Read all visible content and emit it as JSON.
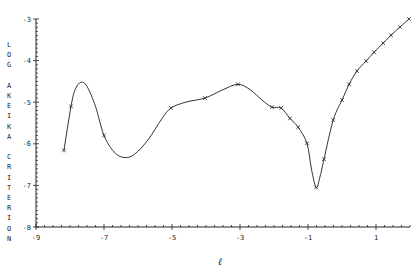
{
  "chart_data": {
    "type": "line",
    "title": "",
    "xlabel": "ℓ",
    "ylabel": "LOG AKAIKE CRITERION",
    "ylabel_letters": [
      "L",
      "O",
      "G",
      "",
      "A",
      "K",
      "E",
      "I",
      "K",
      "A",
      "",
      "C",
      "R",
      "I",
      "T",
      "E",
      "R",
      "I",
      "O",
      "N"
    ],
    "xlim": [
      -9,
      2
    ],
    "ylim": [
      -8,
      -3
    ],
    "xticks": [
      -9,
      -7,
      -5,
      -3,
      -1,
      1
    ],
    "yticks": [
      -3,
      -4,
      -5,
      -6,
      -7,
      -8
    ],
    "minor_ticks": true,
    "grid": false,
    "legend": null,
    "series": [
      {
        "name": "criterion",
        "marker": "x",
        "markers": [
          {
            "x": -8.18,
            "y": -6.16
          },
          {
            "x": -7.97,
            "y": -5.1
          },
          {
            "x": -7.0,
            "y": -5.8
          },
          {
            "x": -5.03,
            "y": -5.14
          },
          {
            "x": -4.03,
            "y": -4.9
          },
          {
            "x": -3.06,
            "y": -4.57
          },
          {
            "x": -2.06,
            "y": -5.12
          },
          {
            "x": -1.79,
            "y": -5.14
          },
          {
            "x": -1.53,
            "y": -5.39
          },
          {
            "x": -1.29,
            "y": -5.6
          },
          {
            "x": -1.03,
            "y": -5.99
          },
          {
            "x": -0.76,
            "y": -7.05
          },
          {
            "x": -0.53,
            "y": -6.37
          },
          {
            "x": -0.26,
            "y": -5.43
          },
          {
            "x": 0.0,
            "y": -4.95
          },
          {
            "x": 0.21,
            "y": -4.57
          },
          {
            "x": 0.44,
            "y": -4.25
          },
          {
            "x": 0.71,
            "y": -4.01
          },
          {
            "x": 0.94,
            "y": -3.8
          },
          {
            "x": 1.21,
            "y": -3.58
          },
          {
            "x": 1.44,
            "y": -3.39
          },
          {
            "x": 1.71,
            "y": -3.19
          },
          {
            "x": 1.97,
            "y": -3.0
          }
        ],
        "curve": [
          {
            "x": -8.18,
            "y": -6.16
          },
          {
            "x": -7.97,
            "y": -5.1
          },
          {
            "x": -7.85,
            "y": -4.7
          },
          {
            "x": -7.68,
            "y": -4.52
          },
          {
            "x": -7.5,
            "y": -4.62
          },
          {
            "x": -7.25,
            "y": -5.1
          },
          {
            "x": -7.0,
            "y": -5.8
          },
          {
            "x": -6.7,
            "y": -6.2
          },
          {
            "x": -6.41,
            "y": -6.33
          },
          {
            "x": -6.1,
            "y": -6.25
          },
          {
            "x": -5.7,
            "y": -5.9
          },
          {
            "x": -5.3,
            "y": -5.4
          },
          {
            "x": -5.03,
            "y": -5.14
          },
          {
            "x": -4.6,
            "y": -5.0
          },
          {
            "x": -4.03,
            "y": -4.9
          },
          {
            "x": -3.5,
            "y": -4.7
          },
          {
            "x": -3.06,
            "y": -4.57
          },
          {
            "x": -2.7,
            "y": -4.7
          },
          {
            "x": -2.35,
            "y": -4.95
          },
          {
            "x": -2.06,
            "y": -5.12
          },
          {
            "x": -1.79,
            "y": -5.14
          },
          {
            "x": -1.53,
            "y": -5.39
          },
          {
            "x": -1.29,
            "y": -5.6
          },
          {
            "x": -1.03,
            "y": -5.99
          },
          {
            "x": -0.9,
            "y": -6.6
          },
          {
            "x": -0.76,
            "y": -7.05
          },
          {
            "x": -0.65,
            "y": -6.8
          },
          {
            "x": -0.53,
            "y": -6.37
          },
          {
            "x": -0.26,
            "y": -5.43
          },
          {
            "x": 0.0,
            "y": -4.95
          },
          {
            "x": 0.21,
            "y": -4.57
          },
          {
            "x": 0.44,
            "y": -4.25
          },
          {
            "x": 0.71,
            "y": -4.01
          },
          {
            "x": 0.94,
            "y": -3.8
          },
          {
            "x": 1.21,
            "y": -3.58
          },
          {
            "x": 1.44,
            "y": -3.39
          },
          {
            "x": 1.71,
            "y": -3.19
          },
          {
            "x": 1.97,
            "y": -3.0
          }
        ]
      }
    ]
  },
  "colors": {
    "line": "#333333",
    "axis": "#222222",
    "background": "#ffffff"
  }
}
